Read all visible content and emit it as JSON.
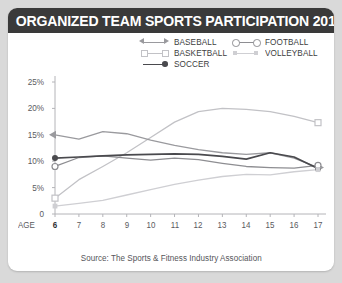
{
  "title": "ORGANIZED TEAM SPORTS PARTICIPATION 2012 (U.S.)",
  "source": "Source: The Sports & Fitness Industry Association",
  "axis": {
    "age_label": "AGE",
    "y_ticks": [
      "25%",
      "20%",
      "15%",
      "10%",
      "5%",
      "0"
    ],
    "x_ticks": [
      "6",
      "7",
      "8",
      "9",
      "10",
      "11",
      "12",
      "13",
      "14",
      "15",
      "16",
      "17"
    ]
  },
  "legend": {
    "left": [
      {
        "label": "BASEBALL",
        "marker": "double-arrow-marker",
        "color": "#9a9a9e"
      },
      {
        "label": "BASKETBALL",
        "marker": "open-square-marker",
        "color": "#c2c2c6"
      },
      {
        "label": "SOCCER",
        "marker": "filled-dot-marker",
        "color": "#4a4a4e"
      }
    ],
    "right": [
      {
        "label": "FOOTBALL",
        "marker": "open-circle-marker",
        "color": "#8e8e92"
      },
      {
        "label": "VOLLEYBALL",
        "marker": "filled-small-square-marker",
        "color": "#cfcfd3"
      }
    ]
  },
  "colors": {
    "title_bar": "#3a3a3a",
    "card": "#ffffff",
    "page_background": "#d9d9d9",
    "baseball": "#9a9a9e",
    "basketball": "#c2c2c6",
    "soccer": "#4a4a4e",
    "football": "#8e8e92",
    "volleyball": "#cfcfd3",
    "axis": "#b4b4b8",
    "tick_text": "#5a5a5e"
  },
  "chart_data": {
    "type": "line",
    "title": "ORGANIZED TEAM SPORTS PARTICIPATION 2012 (U.S.)",
    "xlabel": "AGE",
    "ylabel": "",
    "x": [
      6,
      7,
      8,
      9,
      10,
      11,
      12,
      13,
      14,
      15,
      16,
      17
    ],
    "xlim": [
      6,
      17
    ],
    "ylim": [
      0,
      25
    ],
    "y_unit": "percent",
    "grid": false,
    "legend_position": "top",
    "series": [
      {
        "name": "BASEBALL",
        "color": "#9a9a9e",
        "marker": "double-arrow",
        "values": [
          15.0,
          14.2,
          15.6,
          15.2,
          14.0,
          13.0,
          12.2,
          11.6,
          11.3,
          11.6,
          10.6,
          8.8
        ]
      },
      {
        "name": "BASKETBALL",
        "color": "#c2c2c6",
        "marker": "open-square",
        "values": [
          3.0,
          6.5,
          9.0,
          11.6,
          14.5,
          17.4,
          19.4,
          20.0,
          19.8,
          19.4,
          18.5,
          17.3
        ]
      },
      {
        "name": "SOCCER",
        "color": "#4a4a4e",
        "marker": "filled-dot",
        "values": [
          10.6,
          10.8,
          11.0,
          11.2,
          11.3,
          11.4,
          11.3,
          10.9,
          10.4,
          11.6,
          10.8,
          8.6
        ]
      },
      {
        "name": "FOOTBALL",
        "color": "#8e8e92",
        "marker": "open-circle",
        "values": [
          9.0,
          10.7,
          11.0,
          10.6,
          10.2,
          10.6,
          10.3,
          9.6,
          9.0,
          8.8,
          8.7,
          9.2
        ]
      },
      {
        "name": "VOLLEYBALL",
        "color": "#cfcfd3",
        "marker": "small-square",
        "values": [
          1.5,
          2.0,
          2.6,
          3.6,
          4.6,
          5.6,
          6.4,
          7.1,
          7.5,
          7.4,
          8.0,
          8.4
        ]
      }
    ]
  }
}
